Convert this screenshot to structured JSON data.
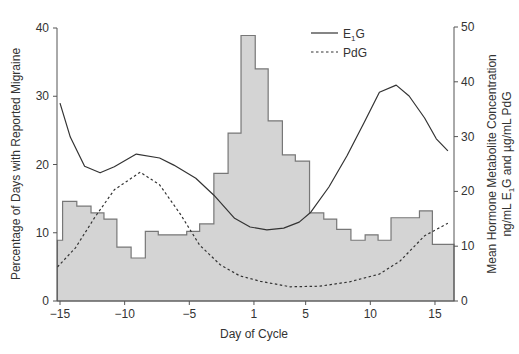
{
  "chart_data": {
    "type": "bar+line",
    "title": "",
    "xlabel": "Day of Cycle",
    "ylabel_left": "Percentage of Days with Reported Migraine",
    "ylabel_right_line1": "Mean Hormone Metabolite Concentration",
    "ylabel_right_line2": "ng/mL E1G and µg/mL PdG",
    "x_ticks": [
      {
        "pos": -15,
        "label": "−15"
      },
      {
        "pos": -10,
        "label": "−10"
      },
      {
        "pos": -5,
        "label": "−5"
      },
      {
        "pos": 0,
        "label": "1"
      },
      {
        "pos": 4,
        "label": "5"
      },
      {
        "pos": 9,
        "label": "10"
      },
      {
        "pos": 14,
        "label": "15"
      }
    ],
    "xlim": [
      -15.2,
      15.3
    ],
    "ylim_left": [
      0,
      40
    ],
    "yticks_left": [
      0,
      10,
      20,
      30,
      40
    ],
    "ylim_right": [
      0,
      50
    ],
    "yticks_right": [
      0,
      10,
      20,
      30,
      40,
      50
    ],
    "grid": false,
    "legend_position": "top-right-inside",
    "histogram": {
      "name": "Percentage of Days with Reported Migraine",
      "axis": "left",
      "fill": "#d4d4d4",
      "stroke": "#777777",
      "bins": [
        {
          "x0": -15.2,
          "x1": -14.8,
          "value": 8.9
        },
        {
          "x0": -14.8,
          "x1": -13.7,
          "value": 14.6
        },
        {
          "x0": -13.7,
          "x1": -12.6,
          "value": 13.9
        },
        {
          "x0": -12.6,
          "x1": -11.6,
          "value": 12.9
        },
        {
          "x0": -11.6,
          "x1": -10.6,
          "value": 12.0
        },
        {
          "x0": -10.6,
          "x1": -9.5,
          "value": 7.9
        },
        {
          "x0": -9.5,
          "x1": -8.4,
          "value": 6.3
        },
        {
          "x0": -8.4,
          "x1": -7.4,
          "value": 10.2
        },
        {
          "x0": -7.4,
          "x1": -6.3,
          "value": 9.7
        },
        {
          "x0": -6.3,
          "x1": -5.2,
          "value": 9.7
        },
        {
          "x0": -5.2,
          "x1": -4.2,
          "value": 10.2
        },
        {
          "x0": -4.2,
          "x1": -3.1,
          "value": 11.3
        },
        {
          "x0": -3.1,
          "x1": -2.0,
          "value": 18.7
        },
        {
          "x0": -2.0,
          "x1": -1.0,
          "value": 24.6
        },
        {
          "x0": -1.0,
          "x1": 0.1,
          "value": 38.9
        },
        {
          "x0": 0.1,
          "x1": 1.1,
          "value": 34.0
        },
        {
          "x0": 1.1,
          "x1": 2.2,
          "value": 26.4
        },
        {
          "x0": 2.2,
          "x1": 3.2,
          "value": 21.4
        },
        {
          "x0": 3.2,
          "x1": 4.3,
          "value": 20.5
        },
        {
          "x0": 4.3,
          "x1": 5.4,
          "value": 12.9
        },
        {
          "x0": 5.4,
          "x1": 6.4,
          "value": 12.0
        },
        {
          "x0": 6.4,
          "x1": 7.5,
          "value": 10.5
        },
        {
          "x0": 7.5,
          "x1": 8.6,
          "value": 8.9
        },
        {
          "x0": 8.6,
          "x1": 9.6,
          "value": 9.7
        },
        {
          "x0": 9.6,
          "x1": 10.6,
          "value": 8.9
        },
        {
          "x0": 10.6,
          "x1": 12.8,
          "value": 12.2
        },
        {
          "x0": 12.8,
          "x1": 13.8,
          "value": 13.2
        },
        {
          "x0": 13.8,
          "x1": 15.5,
          "value": 8.3
        }
      ]
    },
    "series": [
      {
        "name": "E1G",
        "legend_label": "E",
        "legend_sub": "1",
        "legend_suffix": "G",
        "axis": "right",
        "style": "solid",
        "color": "#333333",
        "points": [
          [
            -15.0,
            36.1
          ],
          [
            -14.2,
            29.9
          ],
          [
            -13.1,
            24.6
          ],
          [
            -11.9,
            23.4
          ],
          [
            -10.8,
            24.5
          ],
          [
            -9.1,
            26.8
          ],
          [
            -7.3,
            26.1
          ],
          [
            -6.2,
            24.8
          ],
          [
            -4.5,
            22.4
          ],
          [
            -3.1,
            19.3
          ],
          [
            -1.5,
            15.1
          ],
          [
            -0.3,
            13.5
          ],
          [
            1.0,
            13.0
          ],
          [
            2.3,
            13.3
          ],
          [
            3.5,
            14.4
          ],
          [
            4.4,
            16.2
          ],
          [
            5.8,
            20.8
          ],
          [
            7.2,
            26.5
          ],
          [
            8.5,
            32.5
          ],
          [
            9.7,
            38.1
          ],
          [
            11.0,
            39.4
          ],
          [
            12.0,
            37.4
          ],
          [
            13.2,
            33.4
          ],
          [
            14.1,
            29.6
          ],
          [
            15.0,
            27.4
          ]
        ]
      },
      {
        "name": "PdG",
        "legend_label": "PdG",
        "legend_sub": "",
        "legend_suffix": "",
        "axis": "right",
        "style": "dashed",
        "color": "#333333",
        "points": [
          [
            -15.2,
            6.2
          ],
          [
            -13.8,
            9.7
          ],
          [
            -12.3,
            15.3
          ],
          [
            -10.8,
            20.3
          ],
          [
            -8.8,
            23.5
          ],
          [
            -7.3,
            21.2
          ],
          [
            -5.7,
            15.9
          ],
          [
            -4.2,
            10.2
          ],
          [
            -2.6,
            6.6
          ],
          [
            -1.1,
            4.6
          ],
          [
            0.5,
            3.6
          ],
          [
            2.8,
            2.6
          ],
          [
            5.1,
            2.7
          ],
          [
            7.4,
            3.5
          ],
          [
            9.7,
            4.9
          ],
          [
            11.3,
            7.3
          ],
          [
            13.2,
            11.9
          ],
          [
            15.0,
            14.2
          ]
        ]
      }
    ]
  },
  "legend": {
    "e1g_main": "E",
    "e1g_sub": "1",
    "e1g_tail": "G",
    "pdg": "PdG"
  },
  "axes": {
    "left_ticks": [
      "0",
      "10",
      "20",
      "30",
      "40"
    ],
    "right_ticks": [
      "0",
      "10",
      "20",
      "30",
      "40",
      "50"
    ],
    "x_ticks": [
      "−15",
      "−10",
      "−5",
      "1",
      "5",
      "10",
      "15"
    ],
    "xlabel": "Day of Cycle",
    "ylabel_left": "Percentage of Days with Reported Migraine",
    "ylabel_right_1": "Mean Hormone Metabolite Concentration",
    "ylabel_right_2_a": "ng/mL E",
    "ylabel_right_2_sub": "1",
    "ylabel_right_2_b": "G and µg/mL PdG"
  }
}
